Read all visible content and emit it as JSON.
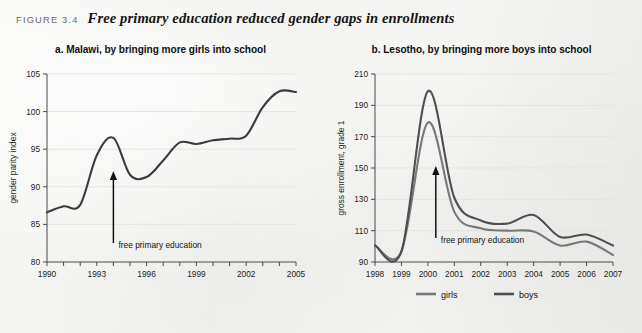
{
  "figure": {
    "number_label": "FIGURE 3.4",
    "title": "Free primary education reduced gender gaps in enrollments",
    "background_color": "#f2f2f0",
    "line_color_dark": "#3b3b3b",
    "line_color_mid": "#6f6f6f"
  },
  "panel_a": {
    "title": "a.  Malawi, by bringing more girls into school",
    "annotation": "free primary education",
    "annotation_year": 1994,
    "chart_data": {
      "type": "line",
      "title": "a.  Malawi, by bringing more girls into school",
      "xlabel": "",
      "ylabel": "gender parity index",
      "xlim": [
        1990,
        2005
      ],
      "ylim": [
        80,
        105
      ],
      "yticks": [
        80,
        85,
        90,
        95,
        100,
        105
      ],
      "xticks": [
        1990,
        1991,
        1992,
        1993,
        1994,
        1995,
        1996,
        1997,
        1998,
        1999,
        2000,
        2001,
        2002,
        2003,
        2004,
        2005
      ],
      "xtick_labels": [
        "1990",
        "",
        "",
        "1993",
        "",
        "",
        "1996",
        "",
        "",
        "1999",
        "",
        "",
        "2002",
        "",
        "",
        "2005"
      ],
      "grid": true,
      "legend": "none",
      "series": [
        {
          "name": "gender parity index",
          "color": "#3b3b3b",
          "x": [
            1990,
            1991,
            1992,
            1993,
            1994,
            1995,
            1996,
            1997,
            1998,
            1999,
            2000,
            2001,
            2002,
            2003,
            2004,
            2005
          ],
          "values": [
            86.6,
            87.4,
            87.6,
            94.2,
            96.5,
            91.6,
            91.3,
            93.5,
            95.9,
            95.7,
            96.2,
            96.4,
            96.8,
            100.6,
            102.7,
            102.6
          ]
        }
      ]
    }
  },
  "panel_b": {
    "title": "b.  Lesotho, by bringing more boys into school",
    "annotation": "free primary education",
    "annotation_year": 2000.3,
    "chart_data": {
      "type": "line",
      "title": "b.  Lesotho, by bringing more boys into school",
      "xlabel": "",
      "ylabel": "gross enrollment, grade 1",
      "xlim": [
        1998,
        2007
      ],
      "ylim": [
        90,
        210
      ],
      "yticks": [
        90,
        110,
        130,
        150,
        170,
        190,
        210
      ],
      "xticks": [
        1998,
        1999,
        2000,
        2001,
        2002,
        2003,
        2004,
        2005,
        2006,
        2007
      ],
      "xtick_labels": [
        "1998",
        "1999",
        "2000",
        "2001",
        "2002",
        "2003",
        "2004",
        "2005",
        "2006",
        "2007"
      ],
      "grid": true,
      "legend": "bottom",
      "series": [
        {
          "name": "girls",
          "color": "#787878",
          "x": [
            1998,
            1999,
            2000,
            2001,
            2002,
            2003,
            2004,
            2005,
            2006,
            2007
          ],
          "values": [
            100.5,
            96.8,
            179.0,
            122.0,
            111.5,
            110.0,
            109.5,
            100.5,
            103.0,
            94.5
          ]
        },
        {
          "name": "boys",
          "color": "#4e4e4e",
          "x": [
            1998,
            1999,
            2000,
            2001,
            2002,
            2003,
            2004,
            2005,
            2006,
            2007
          ],
          "values": [
            100.5,
            96.8,
            199.0,
            131.0,
            116.5,
            114.5,
            120.0,
            106.0,
            107.5,
            100.5
          ]
        }
      ]
    },
    "legend": [
      {
        "label": "girls",
        "color": "#787878"
      },
      {
        "label": "boys",
        "color": "#4e4e4e"
      }
    ]
  }
}
